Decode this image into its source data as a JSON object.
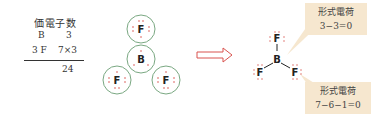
{
  "valence_table": {
    "title": "価電子数",
    "rows": [
      {
        "label": "B",
        "value": "3"
      },
      {
        "label": "3 F",
        "value": "7×3"
      }
    ],
    "total": "24"
  },
  "electron_diagram": {
    "atoms": [
      {
        "symbol": "F",
        "position": "top"
      },
      {
        "symbol": "B",
        "position": "center"
      },
      {
        "symbol": "F",
        "position": "left"
      },
      {
        "symbol": "F",
        "position": "right"
      }
    ],
    "circle_color": "#7aa882",
    "dot_color": "#d9534f"
  },
  "arrow": {
    "color": "#d9534f",
    "style": "hollow-right-arrow"
  },
  "lewis_structure": {
    "central": "B",
    "terminals": [
      "F",
      "F",
      "F"
    ]
  },
  "callouts": [
    {
      "title": "形式電荷",
      "formula": "3−3=0",
      "target": "B"
    },
    {
      "title": "形式電荷",
      "formula": "7−6−1=0",
      "target": "F"
    }
  ],
  "colors": {
    "callout_bg": "#f6e7cf",
    "text": "#333333"
  }
}
